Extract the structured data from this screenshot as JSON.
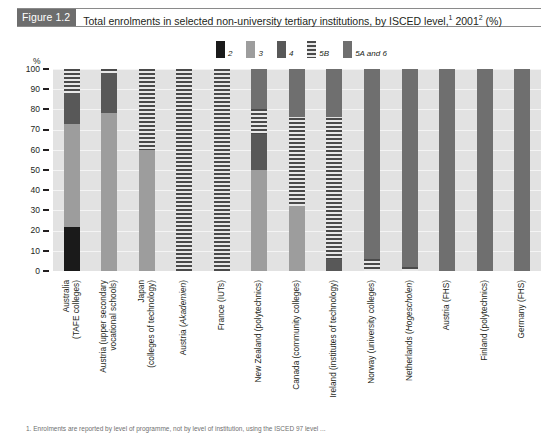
{
  "figure": {
    "tag": "Figure 1.2",
    "title_main": "Total enrolments in selected non-university tertiary institutions, by ISCED level,",
    "title_sup1": "1",
    "title_year": " 2001",
    "title_sup2": "2",
    "title_tail": " (%)"
  },
  "legend": {
    "position": "top-center",
    "items": [
      {
        "label": "2",
        "key": "2",
        "color": "#1a1a1a",
        "pattern": "solid"
      },
      {
        "label": "3",
        "key": "3",
        "color": "#9d9d9d",
        "pattern": "solid"
      },
      {
        "label": "4",
        "key": "4",
        "color": "#585858",
        "pattern": "solid"
      },
      {
        "label": "5B",
        "key": "5B",
        "color": "#4a4a4a",
        "pattern": "horizontal-stripes"
      },
      {
        "label": "5A and 6",
        "key": "5A",
        "color": "#6f6f6f",
        "pattern": "solid"
      }
    ]
  },
  "axis": {
    "y_unit": "%",
    "y_ticks": [
      "100",
      "90",
      "80",
      "70",
      "60",
      "50",
      "40",
      "30",
      "20",
      "10",
      "0"
    ],
    "ylim": [
      0,
      100
    ],
    "grid": true
  },
  "footnote": "1. Enrolments are reported by level of programme, not by level of institution, using the ISCED 97 level ...",
  "chart_data": {
    "type": "bar",
    "subtype": "stacked-100-percent",
    "xlabel": "",
    "ylabel": "%",
    "ylim": [
      0,
      100
    ],
    "grid": true,
    "legend_position": "top-center",
    "categories": [
      "Australia (TAFE colleges)",
      "Austria (upper secondary vocational schools)",
      "Japan (colleges of technology)",
      "Austria (Akademien)",
      "France (IUTs)",
      "New Zealand (polytechnics)",
      "Canada (community colleges)",
      "Ireland (institutes of technology)",
      "Norway (university colleges)",
      "Netherlands (Hogescholen)",
      "Austria (FHS)",
      "Finland (polytechnics)",
      "Germany (FHS)"
    ],
    "category_lines": [
      [
        "Australia",
        "(TAFE colleges)"
      ],
      [
        "Austria (upper secondary",
        "vocational schools)"
      ],
      [
        "Japan",
        "(colleges of technology)"
      ],
      [
        "Austria (Akademien)"
      ],
      [
        "France (IUTs)"
      ],
      [
        "New Zealand (polytechnics)"
      ],
      [
        "Canada (community colleges)"
      ],
      [
        "Ireland (institutes of technology)"
      ],
      [
        "Norway (university colleges)"
      ],
      [
        "Netherlands (Hogescholen)"
      ],
      [
        "Austria (FHS)"
      ],
      [
        "Finland (polytechnics)"
      ],
      [
        "Germany (FHS)"
      ]
    ],
    "series": [
      {
        "name": "2",
        "key": "2",
        "values": [
          22,
          0,
          0,
          0,
          0,
          0,
          0,
          0,
          0,
          0,
          0,
          0,
          0
        ]
      },
      {
        "name": "3",
        "key": "3",
        "values": [
          51,
          78,
          60,
          0,
          0,
          50,
          32,
          0,
          0,
          0,
          0,
          0,
          0
        ]
      },
      {
        "name": "4",
        "key": "4",
        "values": [
          15,
          20,
          0,
          0,
          0,
          18,
          0,
          6,
          0,
          0,
          0,
          0,
          0
        ]
      },
      {
        "name": "5B",
        "key": "5B",
        "values": [
          12,
          2,
          40,
          100,
          100,
          12,
          44,
          70,
          6,
          2,
          0,
          0,
          0
        ]
      },
      {
        "name": "5A and 6",
        "key": "5A",
        "values": [
          0,
          0,
          0,
          0,
          0,
          20,
          24,
          24,
          94,
          98,
          100,
          100,
          100
        ]
      }
    ]
  }
}
